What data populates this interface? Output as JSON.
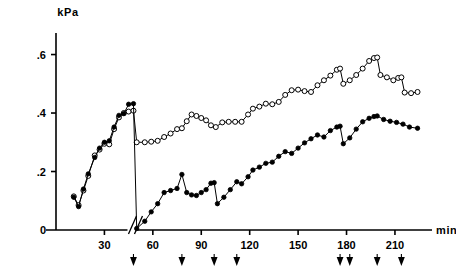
{
  "chart_data": {
    "type": "line",
    "title": "",
    "xlabel": "min",
    "ylabel": "kPa",
    "xlim": [
      0,
      228
    ],
    "ylim": [
      0,
      0.66
    ],
    "grid": false,
    "legend": "none",
    "axis_break_at": 48,
    "y_ticks": [
      0,
      0.2,
      0.4,
      0.6
    ],
    "y_tick_labels": [
      "0",
      ".2",
      ".4",
      ".6"
    ],
    "x_ticks": [
      30,
      60,
      90,
      120,
      150,
      180,
      210
    ],
    "x_tick_labels": [
      "30",
      "60",
      "90",
      "120",
      "150",
      "180",
      "210"
    ],
    "arrow_markers": [
      48,
      78,
      98,
      112,
      176,
      182,
      199,
      214
    ],
    "series": [
      {
        "name": "open-circles",
        "marker": "open-circle",
        "color": "#000000",
        "points": [
          [
            11,
            0.115
          ],
          [
            14,
            0.085
          ],
          [
            17,
            0.135
          ],
          [
            20,
            0.185
          ],
          [
            24,
            0.255
          ],
          [
            27,
            0.275
          ],
          [
            30,
            0.295
          ],
          [
            33,
            0.293
          ],
          [
            36,
            0.345
          ],
          [
            39,
            0.385
          ],
          [
            42,
            0.4
          ],
          [
            45,
            0.405
          ],
          [
            48,
            0.408
          ],
          [
            50,
            0.3
          ],
          [
            55,
            0.3
          ],
          [
            59,
            0.302
          ],
          [
            63,
            0.305
          ],
          [
            67,
            0.318
          ],
          [
            71,
            0.33
          ],
          [
            75,
            0.345
          ],
          [
            78,
            0.348
          ],
          [
            81,
            0.372
          ],
          [
            84,
            0.395
          ],
          [
            87,
            0.39
          ],
          [
            90,
            0.383
          ],
          [
            93,
            0.375
          ],
          [
            96,
            0.358
          ],
          [
            99,
            0.352
          ],
          [
            103,
            0.368
          ],
          [
            107,
            0.37
          ],
          [
            111,
            0.37
          ],
          [
            115,
            0.37
          ],
          [
            119,
            0.395
          ],
          [
            122,
            0.415
          ],
          [
            126,
            0.422
          ],
          [
            130,
            0.432
          ],
          [
            134,
            0.43
          ],
          [
            138,
            0.438
          ],
          [
            142,
            0.462
          ],
          [
            146,
            0.478
          ],
          [
            150,
            0.48
          ],
          [
            154,
            0.475
          ],
          [
            158,
            0.472
          ],
          [
            162,
            0.495
          ],
          [
            166,
            0.512
          ],
          [
            170,
            0.528
          ],
          [
            174,
            0.548
          ],
          [
            176,
            0.552
          ],
          [
            178,
            0.5
          ],
          [
            182,
            0.512
          ],
          [
            186,
            0.53
          ],
          [
            190,
            0.552
          ],
          [
            194,
            0.578
          ],
          [
            197,
            0.588
          ],
          [
            199,
            0.59
          ],
          [
            201,
            0.53
          ],
          [
            205,
            0.522
          ],
          [
            209,
            0.512
          ],
          [
            212,
            0.52
          ],
          [
            214,
            0.522
          ],
          [
            216,
            0.47
          ],
          [
            220,
            0.468
          ],
          [
            224,
            0.472
          ]
        ]
      },
      {
        "name": "filled-circles",
        "marker": "filled-circle",
        "color": "#000000",
        "points": [
          [
            11,
            0.112
          ],
          [
            14,
            0.08
          ],
          [
            17,
            0.14
          ],
          [
            20,
            0.192
          ],
          [
            24,
            0.248
          ],
          [
            27,
            0.28
          ],
          [
            30,
            0.3
          ],
          [
            33,
            0.305
          ],
          [
            36,
            0.352
          ],
          [
            39,
            0.392
          ],
          [
            42,
            0.398
          ],
          [
            45,
            0.43
          ],
          [
            48,
            0.432
          ],
          [
            50,
            0.005
          ],
          [
            55,
            0.03
          ],
          [
            59,
            0.062
          ],
          [
            63,
            0.09
          ],
          [
            67,
            0.128
          ],
          [
            71,
            0.135
          ],
          [
            75,
            0.142
          ],
          [
            78,
            0.19
          ],
          [
            81,
            0.128
          ],
          [
            84,
            0.12
          ],
          [
            87,
            0.118
          ],
          [
            90,
            0.128
          ],
          [
            93,
            0.138
          ],
          [
            96,
            0.16
          ],
          [
            98,
            0.162
          ],
          [
            100,
            0.09
          ],
          [
            104,
            0.112
          ],
          [
            108,
            0.138
          ],
          [
            112,
            0.165
          ],
          [
            115,
            0.158
          ],
          [
            119,
            0.182
          ],
          [
            122,
            0.205
          ],
          [
            126,
            0.215
          ],
          [
            130,
            0.228
          ],
          [
            134,
            0.232
          ],
          [
            138,
            0.252
          ],
          [
            142,
            0.268
          ],
          [
            146,
            0.262
          ],
          [
            150,
            0.28
          ],
          [
            154,
            0.298
          ],
          [
            158,
            0.312
          ],
          [
            162,
            0.325
          ],
          [
            166,
            0.318
          ],
          [
            170,
            0.34
          ],
          [
            174,
            0.352
          ],
          [
            176,
            0.355
          ],
          [
            178,
            0.295
          ],
          [
            182,
            0.315
          ],
          [
            186,
            0.345
          ],
          [
            190,
            0.37
          ],
          [
            194,
            0.382
          ],
          [
            197,
            0.388
          ],
          [
            199,
            0.39
          ],
          [
            203,
            0.378
          ],
          [
            207,
            0.372
          ],
          [
            211,
            0.368
          ],
          [
            215,
            0.362
          ],
          [
            219,
            0.352
          ],
          [
            224,
            0.348
          ]
        ]
      }
    ]
  }
}
